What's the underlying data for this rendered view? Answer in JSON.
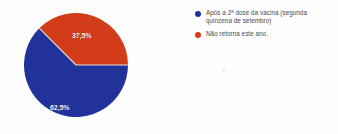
{
  "chart_data": {
    "type": "pie",
    "title": "",
    "subtitle": "",
    "xlabel": "",
    "ylabel": "",
    "grid": false,
    "legend_position": "right",
    "categories": [
      "Após a 2ª dose da vacina (segunda quinzena de setembro)",
      "Não retorna este ano."
    ],
    "values": [
      62.5,
      37.5
    ],
    "value_labels": [
      "62,5%",
      "37,5%"
    ],
    "colors": [
      "#22329b",
      "#d33c18"
    ],
    "slices": [
      {
        "label": "Após a 2ª dose da vacina (segunda quinzena de setembro)",
        "value": 62.5,
        "value_label": "62,5%",
        "color": "#22329b"
      },
      {
        "label": "Não retorna este ano.",
        "value": 37.5,
        "value_label": "37,5%",
        "color": "#d33c18"
      }
    ]
  },
  "legend": {
    "items": [
      {
        "marker_color": "#22329b",
        "label": "Após a 2ª dose da vacina (segunda quinzena de setembro)"
      },
      {
        "marker_color": "#d33c18",
        "label": "Não retorna este ano."
      }
    ]
  },
  "pie": {
    "label_red": "37,5%",
    "label_blue": "62,5%"
  }
}
